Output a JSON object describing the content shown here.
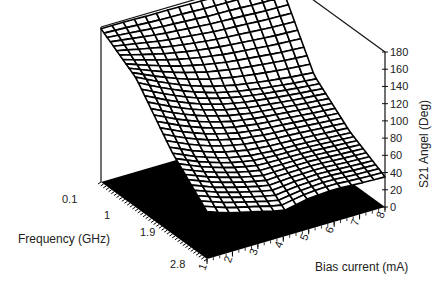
{
  "chart_data": {
    "type": "surface3d",
    "title": "",
    "x_axis": {
      "label": "Frequency  (GHz)",
      "ticks": [
        "0.1",
        "1",
        "1.9",
        "2.8"
      ],
      "range": [
        0.1,
        2.8
      ]
    },
    "y_axis": {
      "label": "Bias current  (mA)",
      "ticks": [
        "1",
        "2",
        "3",
        "4",
        "5",
        "6",
        "7",
        "8"
      ],
      "range": [
        1,
        8
      ]
    },
    "z_axis": {
      "label": "S21 Angel (Deg)",
      "ticks": [
        "0",
        "20",
        "40",
        "60",
        "80",
        "100",
        "120",
        "140",
        "160",
        "180"
      ],
      "range": [
        0,
        180
      ]
    },
    "floor_color": "#000000",
    "mesh_color": "#000000",
    "grid": false,
    "legend": null,
    "frequency_samples": [
      0.1,
      1.0,
      1.9,
      2.8
    ],
    "bias_samples": [
      1,
      2,
      3,
      4,
      5,
      6,
      7,
      8
    ],
    "series": [
      {
        "name": "0.1 GHz",
        "values": [
          178,
          178,
          177,
          177,
          176,
          176,
          175,
          175
        ]
      },
      {
        "name": "1 GHz",
        "values": [
          150,
          135,
          122,
          112,
          105,
          100,
          96,
          93
        ]
      },
      {
        "name": "1.9 GHz",
        "values": [
          95,
          82,
          72,
          66,
          63,
          62,
          60,
          58
        ]
      },
      {
        "name": "2.8 GHz",
        "values": [
          55,
          45,
          38,
          30,
          36,
          38,
          36,
          35
        ]
      }
    ]
  }
}
